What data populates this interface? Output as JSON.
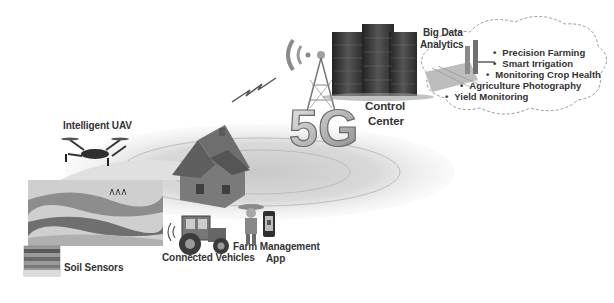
{
  "diagram": {
    "nodes": {
      "uav": {
        "label": "Intelligent UAV",
        "icon": "drone-icon"
      },
      "soil_sensors": {
        "label": "Soil Sensors",
        "icon": "soil-sensor-icon"
      },
      "connected_vehicles": {
        "label": "Connected Vehicles",
        "icon": "tractor-icon"
      },
      "farm_app": {
        "label_line1": "Farm Management",
        "label_line2": "App",
        "icon": "smartphone-icon"
      },
      "network": {
        "label": "5G",
        "icon": "cell-tower-icon"
      },
      "control_center": {
        "label_line1": "Control",
        "label_line2": "Center",
        "icon": "server-rack-icon"
      },
      "big_data": {
        "label_line1": "Big Data",
        "label_line2": "Analytics",
        "icon": "analytics-icon"
      }
    },
    "analytics_services": [
      "Precision Farming",
      "Smart Irrigation",
      "Monitoring Crop Health",
      "Agriculture Photography",
      "Yield Monitoring"
    ],
    "colors": {
      "background": "#ffffff",
      "text": "#333333",
      "field": "#d8d8d8",
      "server": "#3a3a3a",
      "cloud_outline": "#9a9a9a"
    }
  }
}
